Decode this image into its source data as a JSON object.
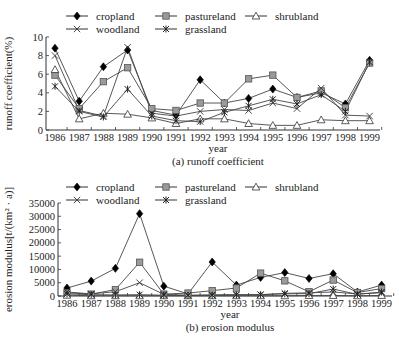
{
  "chart_data": [
    {
      "type": "line",
      "title": "(a) runoff coefficient",
      "xlabel": "year",
      "ylabel": "runoff coefficient(%)",
      "ylim": [
        0,
        10
      ],
      "yticks": [
        0,
        2,
        4,
        6,
        8,
        10
      ],
      "grid": false,
      "legend_position": "top",
      "categories": [
        "1986",
        "1987",
        "1988",
        "1989",
        "1990",
        "1991",
        "1992",
        "1993",
        "1994",
        "1995",
        "1996",
        "1997",
        "1998",
        "1999"
      ],
      "series": [
        {
          "name": "cropland",
          "marker": "diamond-filled",
          "values": [
            8.8,
            3.1,
            6.8,
            8.6,
            2.1,
            1.6,
            5.4,
            2.9,
            3.4,
            4.4,
            3.5,
            4.0,
            2.8,
            7.5
          ]
        },
        {
          "name": "pastureland",
          "marker": "square-gray",
          "values": [
            5.9,
            2.3,
            5.2,
            6.7,
            2.3,
            2.1,
            2.9,
            2.9,
            5.5,
            5.9,
            3.5,
            4.2,
            2.4,
            7.2
          ]
        },
        {
          "name": "shrubland",
          "marker": "triangle-open",
          "values": [
            6.5,
            1.2,
            1.8,
            1.7,
            1.3,
            0.7,
            1.2,
            1.2,
            0.7,
            0.5,
            0.5,
            1.1,
            1.0,
            1.0
          ]
        },
        {
          "name": "woodland",
          "marker": "x",
          "values": [
            8.0,
            2.1,
            1.5,
            8.9,
            1.8,
            1.5,
            2.0,
            2.2,
            2.1,
            2.9,
            2.3,
            4.5,
            1.6,
            1.5
          ]
        },
        {
          "name": "grassland",
          "marker": "star",
          "values": [
            4.7,
            2.0,
            1.4,
            4.4,
            1.5,
            1.0,
            0.9,
            1.9,
            2.6,
            3.3,
            2.8,
            3.8,
            2.0,
            7.3
          ]
        }
      ]
    },
    {
      "type": "line",
      "title": "(b) erosion modulus",
      "xlabel": "year",
      "ylabel": "erosion modulus[t/(km²·a)]",
      "ylim": [
        0,
        35000
      ],
      "yticks": [
        0,
        5000,
        10000,
        15000,
        20000,
        25000,
        30000,
        35000
      ],
      "grid": false,
      "legend_position": "top",
      "categories": [
        "1986",
        "1987",
        "1988",
        "1989",
        "1990",
        "1991",
        "1992",
        "1993",
        "1994",
        "1995",
        "1996",
        "1997",
        "1998",
        "1999"
      ],
      "series": [
        {
          "name": "cropland",
          "marker": "diamond-filled",
          "values": [
            3000,
            5600,
            10400,
            31000,
            3700,
            800,
            12800,
            4100,
            7000,
            8800,
            6600,
            8400,
            1500,
            4100
          ]
        },
        {
          "name": "pastureland",
          "marker": "square-gray",
          "values": [
            1200,
            700,
            2400,
            12700,
            700,
            1100,
            2000,
            3000,
            8600,
            5700,
            1600,
            6000,
            1300,
            2800
          ]
        },
        {
          "name": "shrubland",
          "marker": "triangle-open",
          "values": [
            300,
            100,
            100,
            100,
            100,
            100,
            100,
            100,
            100,
            100,
            200,
            200,
            100,
            200
          ]
        },
        {
          "name": "woodland",
          "marker": "x",
          "values": [
            1500,
            800,
            1600,
            5000,
            600,
            300,
            400,
            500,
            500,
            1000,
            1200,
            1500,
            800,
            1200
          ]
        },
        {
          "name": "grassland",
          "marker": "star",
          "values": [
            800,
            500,
            400,
            500,
            300,
            200,
            300,
            400,
            500,
            800,
            900,
            2600,
            600,
            1500
          ]
        }
      ]
    }
  ],
  "charts": {
    "a": {
      "caption": "(a) runoff coefficient",
      "xlabel": "year",
      "ylabel": "runoff coefficient(%)",
      "yticks": [
        "0",
        "2",
        "4",
        "6",
        "8",
        "10"
      ],
      "xticks": [
        "1986",
        "1987",
        "1988",
        "1989",
        "1990",
        "1991",
        "1992",
        "1993",
        "1994",
        "1995",
        "1996",
        "1997",
        "1998",
        "1999"
      ],
      "legend": [
        "cropland",
        "pastureland",
        "shrubland",
        "woodland",
        "grassland"
      ]
    },
    "b": {
      "caption": "(b) erosion modulus",
      "xlabel": "year",
      "ylabel": "erosion modulus[t/(km² · a)]",
      "yticks": [
        "0",
        "5000",
        "10000",
        "15000",
        "20000",
        "25000",
        "30000",
        "35000"
      ],
      "xticks": [
        "1986",
        "1987",
        "1988",
        "1989",
        "1990",
        "1991",
        "1992",
        "1993",
        "1994",
        "1995",
        "1996",
        "1997",
        "1998",
        "1999"
      ],
      "legend": [
        "cropland",
        "pastureland",
        "shrubland",
        "woodland",
        "grassland"
      ]
    }
  }
}
